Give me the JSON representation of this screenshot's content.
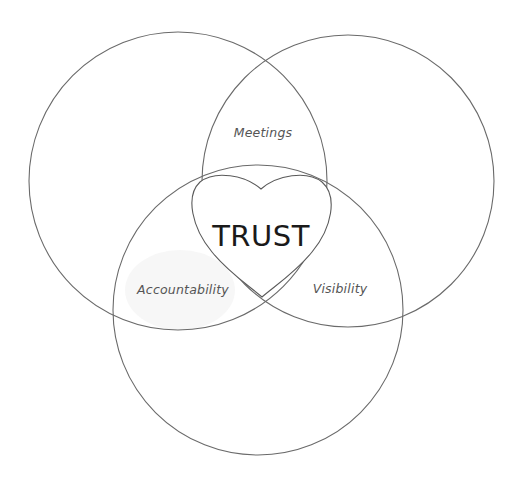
{
  "diagram": {
    "type": "venn",
    "center_label": "TRUST",
    "regions": [
      {
        "id": "top",
        "label": "Meetings"
      },
      {
        "id": "left",
        "label": "Accountability"
      },
      {
        "id": "right",
        "label": "Visibility"
      }
    ],
    "circles": [
      {
        "id": "left-circle",
        "cx": 178,
        "cy": 181,
        "r": 149
      },
      {
        "id": "right-circle",
        "cx": 348,
        "cy": 181,
        "r": 146
      },
      {
        "id": "bottom-circle",
        "cx": 258,
        "cy": 310,
        "r": 145
      }
    ],
    "colors": {
      "stroke": "#6a6a6a",
      "text": "#555555",
      "center_text": "#1a1a1a",
      "shade": "#f2f2f2"
    }
  }
}
